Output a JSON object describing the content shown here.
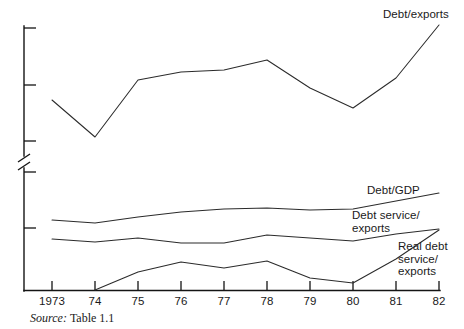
{
  "figure": {
    "source_note_label": "Source:",
    "source_note_value": "Table 1.1"
  },
  "chart_data": {
    "type": "line",
    "title": "",
    "subtitle": "",
    "xlabel": "",
    "ylabel": "",
    "grid": false,
    "legend_position": "inline-right-of-line-ends",
    "axis_break": true,
    "axis_break_note": "Y axis has a break (zigzag) between the upper Debt/exports band and the lower ratio band",
    "y_axis_tick_labels": [],
    "y_axis_ticks_unlabeled_count": 5,
    "x": [
      "1973",
      "74",
      "75",
      "76",
      "77",
      "78",
      "79",
      "80",
      "81",
      "82"
    ],
    "categories": [
      "1973",
      "74",
      "75",
      "76",
      "77",
      "78",
      "79",
      "80",
      "81",
      "82"
    ],
    "series": [
      {
        "name": "Debt/exports",
        "label_lines": "Debt/exports",
        "values": [
          100,
          137,
          80,
          72,
          70,
          60,
          88,
          108,
          78,
          25
        ],
        "values_note": "pixel-space y positions on the upper broken axis panel; lower value = higher ratio",
        "starts_at": "1973"
      },
      {
        "name": "Debt/GDP",
        "label_lines": "Debt/GDP",
        "values": [
          220,
          223,
          217,
          212,
          209,
          208,
          210,
          209,
          201,
          193
        ],
        "values_note": "pixel-space y positions on the lower axis panel; lower value = higher ratio",
        "starts_at": "1973"
      },
      {
        "name": "Debt service/exports",
        "label_lines": "Debt service/\nexports",
        "values": [
          239,
          242,
          238,
          243,
          243,
          235,
          238,
          241,
          234,
          229
        ],
        "values_note": "pixel-space y positions on the lower axis panel; lower value = higher ratio",
        "starts_at": "1973"
      },
      {
        "name": "Real debt service/exports",
        "label_lines": "Real debt\nservice/\nexports",
        "values": [
          null,
          290,
          272,
          262,
          268,
          261,
          278,
          283,
          259,
          230
        ],
        "values_note": "pixel-space y positions on the lower axis panel; series begins at the x-axis baseline in 74",
        "starts_at": "74"
      }
    ],
    "series_labels": [
      {
        "name": "Debt/exports",
        "text": "Debt/exports",
        "x": 383,
        "y": 8
      },
      {
        "name": "Debt/GDP",
        "text": "Debt/GDP",
        "x": 367,
        "y": 184
      },
      {
        "name": "Debt service/exports",
        "text": "Debt service/\nexports",
        "x": 352,
        "y": 209
      },
      {
        "name": "Real debt service/exports",
        "text": "Real debt\nservice/\nexports",
        "x": 398,
        "y": 240
      }
    ],
    "colors": {
      "line": "#2b2b2b",
      "axis": "#141414",
      "background": "#ffffff",
      "text": "#1a1a1a"
    }
  }
}
